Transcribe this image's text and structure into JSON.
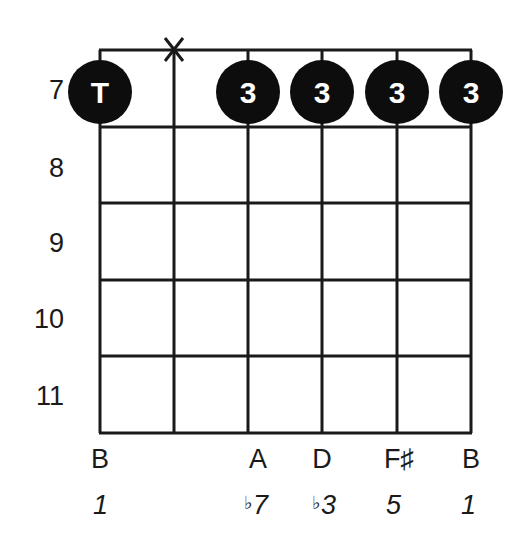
{
  "diagram": {
    "type": "guitar-chord-diagram",
    "start_fret": 7,
    "fret_numbers": [
      "7",
      "8",
      "9",
      "10",
      "11"
    ],
    "strings": [
      {
        "index": 0,
        "note": "B",
        "interval_flat": "",
        "interval": "1",
        "fret": 7,
        "finger": "T",
        "muted": false
      },
      {
        "index": 1,
        "note": "",
        "interval_flat": "",
        "interval": "",
        "fret": null,
        "finger": "",
        "muted": true,
        "mute_symbol": "X"
      },
      {
        "index": 2,
        "note": "A",
        "interval_flat": "♭",
        "interval": "7",
        "fret": 7,
        "finger": "3",
        "muted": false
      },
      {
        "index": 3,
        "note": "D",
        "interval_flat": "♭",
        "interval": "3",
        "fret": 7,
        "finger": "3",
        "muted": false
      },
      {
        "index": 4,
        "note": "F♯",
        "interval_flat": "",
        "interval": "5",
        "fret": 7,
        "finger": "3",
        "muted": false
      },
      {
        "index": 5,
        "note": "B",
        "interval_flat": "",
        "interval": "1",
        "fret": 7,
        "finger": "3",
        "muted": false
      }
    ],
    "colors": {
      "line": "#1a1a1a",
      "dot_fill": "#0d0d0d",
      "dot_text": "#ffffff",
      "background": "#ffffff"
    }
  }
}
